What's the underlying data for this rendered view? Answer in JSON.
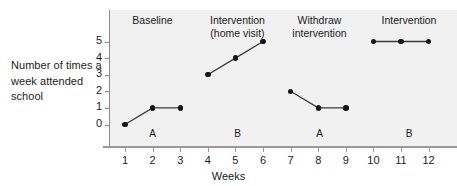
{
  "chart_data": {
    "type": "line",
    "title": "",
    "xlabel": "Weeks",
    "ylabel": "Number of\ntimes a week\nattended school",
    "xlim": [
      0.5,
      12.5
    ],
    "ylim": [
      0,
      5
    ],
    "grid": false,
    "legend": "none",
    "x_ticks": [
      "1",
      "2",
      "3",
      "4",
      "5",
      "6",
      "7",
      "8",
      "9",
      "10",
      "11",
      "12"
    ],
    "y_ticks": [
      "0",
      "1",
      "2",
      "3",
      "4",
      "5"
    ],
    "x": [
      1,
      2,
      3,
      4,
      5,
      6,
      7,
      8,
      9,
      10,
      11,
      12
    ],
    "values": [
      0,
      1,
      1,
      3,
      4,
      5,
      2,
      1,
      1,
      5,
      5,
      5
    ],
    "series": [
      {
        "name": "Baseline",
        "phase": "A",
        "x": [
          1,
          2,
          3
        ],
        "values": [
          0,
          1,
          1
        ]
      },
      {
        "name": "Intervention (home visit)",
        "phase": "B",
        "x": [
          4,
          5,
          6
        ],
        "values": [
          3,
          4,
          5
        ]
      },
      {
        "name": "Withdraw intervention",
        "phase": "A",
        "x": [
          7,
          8,
          9
        ],
        "values": [
          2,
          1,
          1
        ]
      },
      {
        "name": "Intervention",
        "phase": "B",
        "x": [
          10,
          11,
          12
        ],
        "values": [
          5,
          5,
          5
        ]
      }
    ],
    "panels": [
      {
        "title": "Baseline",
        "phase_label": "A"
      },
      {
        "title": "Intervention\n(home visit)",
        "phase_label": "B"
      },
      {
        "title": "Withdraw\nintervention",
        "phase_label": "A"
      },
      {
        "title": "Intervention",
        "phase_label": "B"
      }
    ],
    "colors": {
      "panel_background": "#f1f1f1",
      "figure_background": "#ffffff",
      "marker": "#161616",
      "line": "#3a3a3a",
      "axis": "#8a8a8a",
      "text": "#1b1b1b"
    }
  }
}
